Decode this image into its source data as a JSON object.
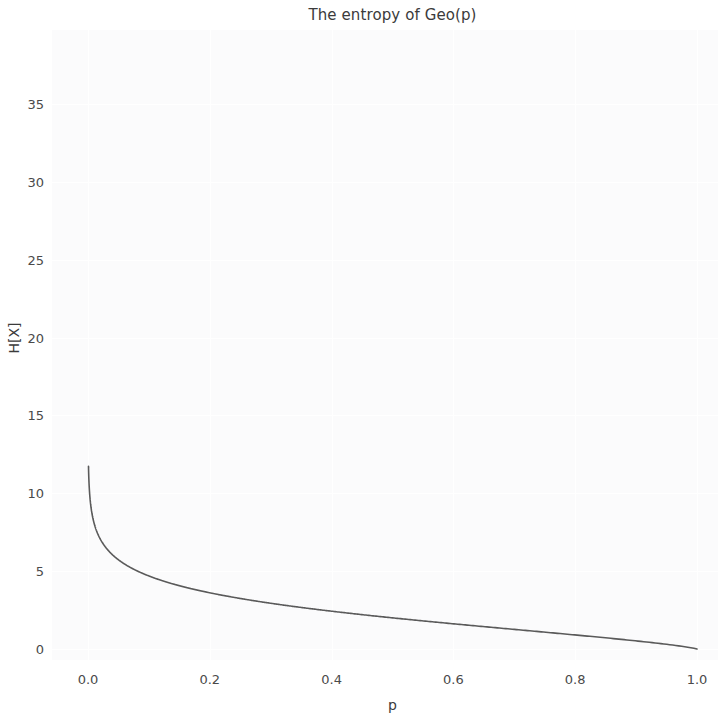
{
  "chart_data": {
    "type": "line",
    "title": "The entropy of Geo(p)",
    "xlabel": "p",
    "ylabel": "H[X]",
    "xlim": [
      -0.05,
      1.05
    ],
    "ylim": [
      -1.5,
      39.5
    ],
    "xticks": [
      "0.0",
      "0.2",
      "0.4",
      "0.6",
      "0.8",
      "1.0"
    ],
    "xtick_values": [
      0.0,
      0.2,
      0.4,
      0.6,
      0.8,
      1.0
    ],
    "yticks": [
      "0",
      "5",
      "10",
      "15",
      "20",
      "25",
      "30",
      "35"
    ],
    "ytick_values": [
      0,
      5,
      10,
      15,
      20,
      25,
      30,
      35
    ],
    "grid": true,
    "legend": null,
    "line_color": "#5a5a5a",
    "background_color": "#fbfbfc",
    "series": [
      {
        "name": "H[X] of Geo(p)",
        "x": [
          0.0008,
          0.001,
          0.0015,
          0.002,
          0.003,
          0.004,
          0.005,
          0.006,
          0.008,
          0.01,
          0.012,
          0.015,
          0.02,
          0.025,
          0.03,
          0.04,
          0.05,
          0.06,
          0.08,
          0.1,
          0.12,
          0.15,
          0.18,
          0.2,
          0.25,
          0.3,
          0.35,
          0.4,
          0.45,
          0.5,
          0.55,
          0.6,
          0.65,
          0.7,
          0.75,
          0.8,
          0.85,
          0.9,
          0.95,
          0.98,
          1.0
        ],
        "y": [
          38.0,
          35.2,
          31.5,
          28.8,
          25.1,
          22.6,
          20.7,
          19.2,
          17.1,
          15.5,
          14.3,
          12.9,
          11.1,
          9.9,
          9.0,
          7.8,
          6.9,
          6.3,
          5.4,
          4.8,
          4.4,
          3.9,
          3.5,
          3.3,
          2.9,
          2.6,
          2.4,
          2.2,
          2.0,
          1.9,
          1.7,
          1.6,
          1.5,
          1.3,
          1.2,
          1.0,
          0.8,
          0.6,
          0.4,
          0.2,
          0.0
        ],
        "formula_note": "H(p) = (-p log2 p - (1-p) log2 (1-p)) / p"
      }
    ]
  }
}
